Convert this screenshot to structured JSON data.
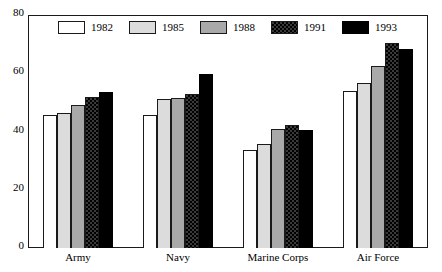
{
  "chart_data": {
    "type": "bar",
    "title": "",
    "subtitle": "",
    "xlabel": "",
    "ylabel": "",
    "ylim": [
      0,
      80
    ],
    "yticks": [
      0,
      20,
      40,
      60,
      80
    ],
    "ytick_labels": [
      "0",
      "20",
      "40",
      "60",
      "80"
    ],
    "grid": false,
    "legend_position": "top-left-inside",
    "categories": [
      "Army",
      "Navy",
      "Marine Corps",
      "Air Force"
    ],
    "series": [
      {
        "name": "1982",
        "color": "#ffffff",
        "pattern": "solid-white",
        "values": [
          45.5,
          45.5,
          33.5,
          54.0
        ]
      },
      {
        "name": "1985",
        "color": "#dcdcdc",
        "pattern": "solid-light-gray",
        "values": [
          46.3,
          51.3,
          35.7,
          56.5
        ]
      },
      {
        "name": "1988",
        "color": "#a9a9a9",
        "pattern": "solid-medium-gray",
        "values": [
          49.2,
          51.5,
          41.0,
          62.5
        ]
      },
      {
        "name": "1991",
        "color": "#3a3a3a",
        "pattern": "checkered-dark",
        "values": [
          51.7,
          53.0,
          42.3,
          70.3
        ]
      },
      {
        "name": "1993",
        "color": "#000000",
        "pattern": "solid-black",
        "values": [
          53.5,
          59.7,
          40.5,
          68.5
        ]
      }
    ]
  },
  "legend": {
    "items": [
      {
        "label": "1982"
      },
      {
        "label": "1985"
      },
      {
        "label": "1988"
      },
      {
        "label": "1991"
      },
      {
        "label": "1993"
      }
    ]
  }
}
